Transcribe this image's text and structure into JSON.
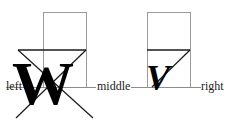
{
  "figure": {
    "type": "typography-alignment-diagram",
    "background_color": "#ffffff",
    "baseline_color": "#8c8c8c",
    "box_color": "#9a9a9a",
    "rule_color": "#1a1a1a",
    "glyph_color": "#000000",
    "text_color": "#1a1a1a"
  },
  "labels": {
    "left": "left",
    "middle": "middle",
    "right": "right"
  },
  "glyphs": {
    "left_character": "W",
    "right_character": "V"
  },
  "geometry": {
    "baseline_y": 87,
    "left_box": {
      "x": 43,
      "y": 12,
      "width": 43,
      "height": 75
    },
    "right_box": {
      "x": 147,
      "y": 12,
      "width": 43,
      "height": 75
    },
    "left_rule": {
      "x1": 18,
      "y1": 50,
      "x2": 86,
      "y2": 50
    },
    "right_rule": {
      "x1": 147,
      "y1": 50,
      "x2": 190,
      "y2": 50
    },
    "left_triangle": {
      "apex_x": 52,
      "apex_y": 118
    },
    "right_diagonal": {
      "x1": 155,
      "y1": 80,
      "x2": 190,
      "y2": 50
    },
    "baseline_segments": [
      {
        "x1": 6,
        "x2": 96
      },
      {
        "x1": 131,
        "x2": 200
      }
    ]
  }
}
